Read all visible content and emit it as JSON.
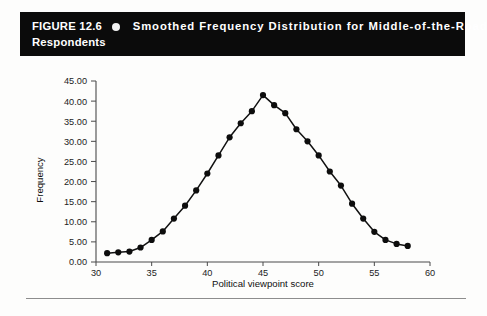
{
  "banner": {
    "figure_label": "FIGURE 12.6",
    "bullet_icon": "circle-bullet-icon",
    "caption_line1": "Smoothed Frequency Distribution for Middle-of-the-Road",
    "caption_line2": "Respondents",
    "background_color": "#0b0b0b",
    "text_color": "#ffffff"
  },
  "page": {
    "background_color": "#fdfdfc",
    "rule_color": "#8d8d8d"
  },
  "chart_data": {
    "type": "line",
    "title": "Smoothed Frequency Distribution for Middle-of-the-Road Respondents",
    "xlabel": "Political viewpoint score",
    "ylabel": "Frequency",
    "xlim": [
      30,
      60
    ],
    "ylim": [
      0,
      45
    ],
    "xticks": [
      30,
      35,
      40,
      45,
      50,
      55,
      60
    ],
    "xtick_labels": [
      "30",
      "35",
      "40",
      "45",
      "50",
      "55",
      "60"
    ],
    "yticks": [
      0,
      5,
      10,
      15,
      20,
      25,
      30,
      35,
      40,
      45
    ],
    "ytick_labels": [
      "0.00",
      "5.00",
      "10.00",
      "15.00",
      "20.00",
      "25.00",
      "30.00",
      "35.00",
      "40.00",
      "45.00"
    ],
    "grid": false,
    "legend": false,
    "marker": "filled-circle",
    "line_color": "#121212",
    "x": [
      31,
      32,
      33,
      34,
      35,
      36,
      37,
      38,
      39,
      40,
      41,
      42,
      43,
      44,
      45,
      46,
      47,
      48,
      49,
      50,
      51,
      52,
      53,
      54,
      55,
      56,
      57,
      58
    ],
    "values": [
      2.2,
      2.4,
      2.6,
      3.6,
      5.5,
      7.6,
      10.8,
      14.0,
      17.8,
      22.0,
      26.5,
      31.0,
      34.5,
      37.5,
      41.5,
      39.0,
      37.0,
      33.0,
      30.0,
      26.5,
      22.5,
      19.0,
      14.5,
      10.8,
      7.5,
      5.5,
      4.5,
      4.0
    ],
    "series": [
      {
        "name": "Smoothed frequency",
        "values": [
          2.2,
          2.4,
          2.6,
          3.6,
          5.5,
          7.6,
          10.8,
          14.0,
          17.8,
          22.0,
          26.5,
          31.0,
          34.5,
          37.5,
          41.5,
          39.0,
          37.0,
          33.0,
          30.0,
          26.5,
          22.5,
          19.0,
          14.5,
          10.8,
          7.5,
          5.5,
          4.5,
          4.0
        ]
      }
    ]
  }
}
